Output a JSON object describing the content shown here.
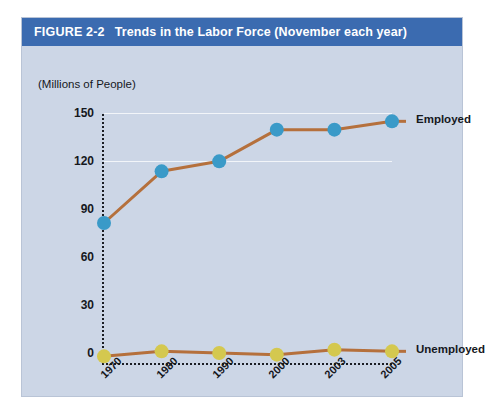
{
  "figure": {
    "number": "FIGURE 2-2",
    "title": "Trends in the Labor Force (November each year)"
  },
  "colors": {
    "title_bar": "#3b6bb0",
    "panel_background": "#ccd6e6",
    "employed_marker": "#3a9ac8",
    "unemployed_marker": "#d4c84f",
    "line": "#b5703c",
    "axis": "#1a1d24",
    "gridline": "#ffffff"
  },
  "chart_data": {
    "type": "line",
    "title": "Trends in the Labor Force (November each year)",
    "xlabel": "",
    "ylabel": "(Millions of People)",
    "categories": [
      "1970",
      "1980",
      "1990",
      "2000",
      "2003",
      "2005"
    ],
    "series": [
      {
        "name": "Employed",
        "color": "#3a9ac8",
        "values": [
          84,
          115,
          121,
          140,
          140,
          145
        ]
      },
      {
        "name": "Unemployed",
        "color": "#d4c84f",
        "values": [
          4,
          7,
          6,
          5,
          8,
          7
        ]
      }
    ],
    "ylim": [
      0,
      158
    ],
    "yticks": [
      0,
      30,
      60,
      90,
      120,
      150
    ],
    "ytick_labels": [
      "0",
      "30",
      "60",
      "90",
      "120",
      "150"
    ],
    "grid": true,
    "legend_position": "inline-right",
    "annotations": [
      {
        "text": "Employed",
        "x": "2005",
        "y": 145
      },
      {
        "text": "Unemployed",
        "x": "2005",
        "y": 7
      }
    ]
  }
}
